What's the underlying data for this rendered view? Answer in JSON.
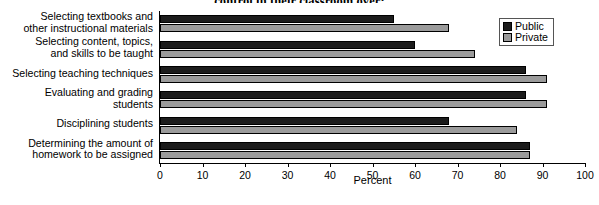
{
  "chart_data": {
    "type": "bar",
    "orientation": "horizontal",
    "title": "control in their classroom over:",
    "xlabel": "Percent",
    "ylabel": "",
    "xlim": [
      0,
      100
    ],
    "xticks": [
      0,
      10,
      20,
      30,
      40,
      50,
      60,
      70,
      80,
      90,
      100
    ],
    "grid": false,
    "legend_position": "top-right",
    "categories": [
      "Selecting textbooks and\nother instructional materials",
      "Selecting content, topics,\nand skills to be taught",
      "Selecting teaching techniques",
      "Evaluating and grading\nstudents",
      "Disciplining students",
      "Determining the amount of\nhomework to be assigned"
    ],
    "series": [
      {
        "name": "Public",
        "color": "#1c1c1c",
        "values": [
          55,
          60,
          86,
          86,
          68,
          87
        ]
      },
      {
        "name": "Private",
        "color": "#9b9b9b",
        "values": [
          68,
          74,
          91,
          91,
          84,
          87
        ]
      }
    ]
  },
  "legend": {
    "items": [
      {
        "label": "Public",
        "swatch": "public"
      },
      {
        "label": "Private",
        "swatch": "private"
      }
    ]
  }
}
